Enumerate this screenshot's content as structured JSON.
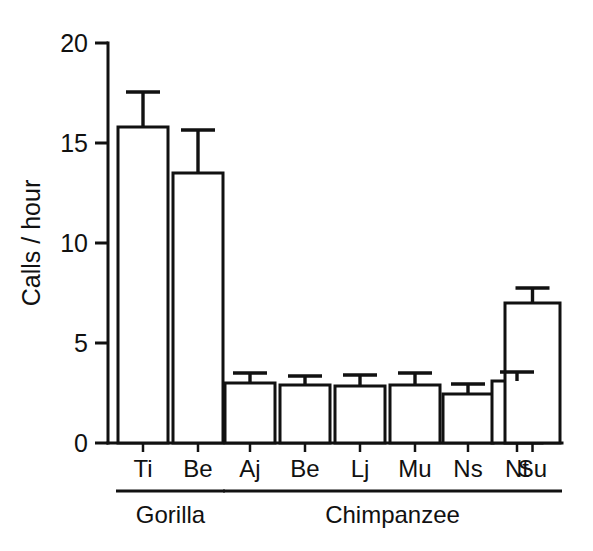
{
  "chart_data": {
    "type": "bar",
    "title": "",
    "xlabel": "",
    "ylabel": "Calls / hour",
    "ylim": [
      0,
      20
    ],
    "yticks": [
      0,
      5,
      10,
      15,
      20
    ],
    "ytick_labels": [
      "0",
      "5",
      "10",
      "15",
      "20"
    ],
    "grid": false,
    "legend": "none",
    "error_bars": "upper only (SE)",
    "categories": [
      "Ti",
      "Be",
      "Aj",
      "Be",
      "Lj",
      "Mu",
      "Ns",
      "Nt",
      "Su"
    ],
    "values": [
      15.8,
      13.5,
      3.0,
      2.9,
      2.85,
      2.9,
      2.45,
      3.1,
      7.0
    ],
    "errors": [
      1.75,
      2.15,
      0.5,
      0.45,
      0.55,
      0.6,
      0.5,
      0.45,
      0.75
    ],
    "groups": [
      {
        "label": "Gorilla",
        "members": [
          "Ti",
          "Be"
        ]
      },
      {
        "label": "Chimpanzee",
        "members": [
          "Aj",
          "Be",
          "Lj",
          "Mu",
          "Ns",
          "Nt",
          "Su"
        ]
      }
    ],
    "bars": [
      {
        "label": "Ti",
        "group": "Gorilla",
        "value": 15.8,
        "error": 1.75,
        "upper": 17.55
      },
      {
        "label": "Be",
        "group": "Gorilla",
        "value": 13.5,
        "error": 2.15,
        "upper": 15.65
      },
      {
        "label": "Aj",
        "group": "Chimpanzee",
        "value": 3.0,
        "error": 0.5,
        "upper": 3.5
      },
      {
        "label": "Be",
        "group": "Chimpanzee",
        "value": 2.9,
        "error": 0.45,
        "upper": 3.35
      },
      {
        "label": "Lj",
        "group": "Chimpanzee",
        "value": 2.85,
        "error": 0.55,
        "upper": 3.4
      },
      {
        "label": "Mu",
        "group": "Chimpanzee",
        "value": 2.9,
        "error": 0.6,
        "upper": 3.5
      },
      {
        "label": "Ns",
        "group": "Chimpanzee",
        "value": 2.45,
        "error": 0.5,
        "upper": 2.95
      },
      {
        "label": "Nt",
        "group": "Chimpanzee",
        "value": 3.1,
        "error": 0.45,
        "upper": 3.55
      },
      {
        "label": "Su",
        "group": "Chimpanzee",
        "value": 7.0,
        "error": 0.75,
        "upper": 7.75
      }
    ],
    "colors": {
      "bar_fill": "#ffffff",
      "bar_stroke": "#111111",
      "axis": "#111111",
      "background": "#ffffff"
    }
  }
}
